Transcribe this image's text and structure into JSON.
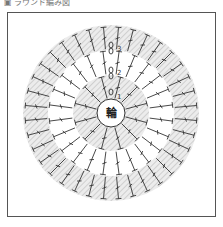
{
  "caption": "▣ ラウンド編み図",
  "diagram": {
    "center_label": "輪",
    "round_labels": [
      "1",
      "2",
      "3"
    ],
    "rounds": 3,
    "stitch_symbol": "treble-crochet",
    "colors": {
      "frame": "#555555",
      "stripe": "#d8d8d8",
      "stitch": "#333333"
    }
  }
}
